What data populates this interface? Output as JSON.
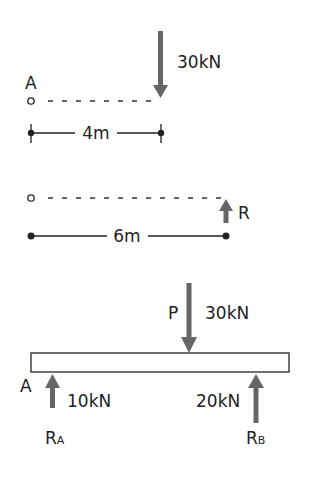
{
  "colors": {
    "arrow": "#666666",
    "line": "#222222",
    "text": "#222222",
    "beam_fill": "#ffffff"
  },
  "panel1": {
    "point_label": "A",
    "load_label": "30kN",
    "dimension_label": "4m"
  },
  "panel2": {
    "reaction_label": "R",
    "dimension_label": "6m"
  },
  "panel3": {
    "point_label": "A",
    "load_name": "P",
    "load_value": "30kN",
    "reaction_a_value": "10kN",
    "reaction_a_name": "R",
    "reaction_a_sub": "A",
    "reaction_b_value": "20kN",
    "reaction_b_name": "R",
    "reaction_b_sub": "B"
  }
}
